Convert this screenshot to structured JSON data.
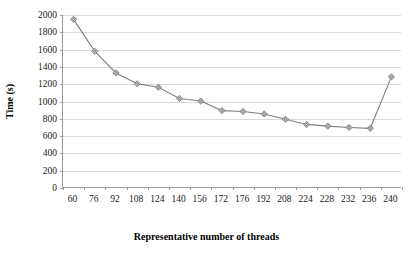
{
  "chart_data": {
    "type": "line",
    "title": "",
    "xlabel": "Representative number of threads",
    "ylabel": "Time (s)",
    "categories": [
      "60",
      "76",
      "92",
      "108",
      "124",
      "140",
      "156",
      "172",
      "176",
      "192",
      "208",
      "224",
      "228",
      "232",
      "236",
      "240"
    ],
    "values": [
      1950,
      1580,
      1330,
      1205,
      1165,
      1035,
      1005,
      895,
      885,
      855,
      795,
      735,
      715,
      700,
      690,
      1285
    ],
    "series": [
      {
        "name": "Time (s)",
        "values": [
          1950,
          1580,
          1330,
          1205,
          1165,
          1035,
          1005,
          895,
          885,
          855,
          795,
          735,
          715,
          700,
          690,
          1285
        ]
      }
    ],
    "ylim": [
      0,
      2000
    ],
    "yticks": [
      "0",
      "200",
      "400",
      "600",
      "800",
      "1000",
      "1200",
      "1400",
      "1600",
      "1800",
      "2000"
    ],
    "ytick_values": [
      0,
      200,
      400,
      600,
      800,
      1000,
      1200,
      1400,
      1600,
      1800,
      2000
    ],
    "grid": true,
    "legend": false,
    "legend_position": "none",
    "marker": "diamond",
    "colors": {
      "line": "#808080",
      "marker_fill": "#c8c8c8",
      "marker_stroke": "#767676",
      "grid": "#d9d9d9",
      "axis": "#9a9a9a",
      "text": "#000000"
    }
  }
}
